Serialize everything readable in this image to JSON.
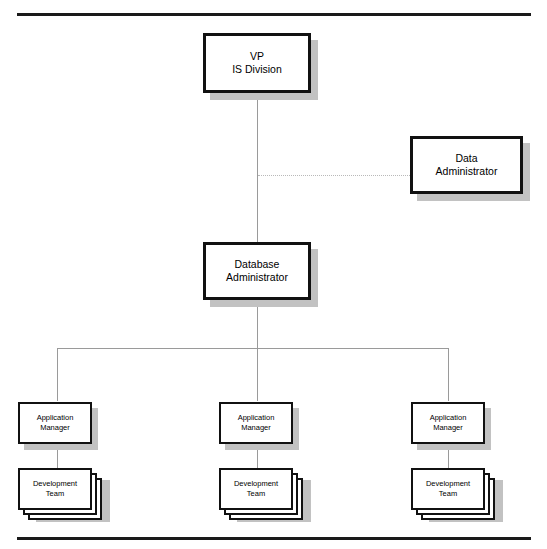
{
  "diagram": {
    "type": "organization-chart",
    "nodes": {
      "vp": {
        "line1": "VP",
        "line2": "IS Division"
      },
      "data_admin": {
        "line1": "Data",
        "line2": "Administrator"
      },
      "dba": {
        "line1": "Database",
        "line2": "Administrator"
      },
      "app_mgr_1": {
        "line1": "Application",
        "line2": "Manager"
      },
      "app_mgr_2": {
        "line1": "Application",
        "line2": "Manager"
      },
      "app_mgr_3": {
        "line1": "Application",
        "line2": "Manager"
      },
      "dev_team_1": {
        "line1": "Development",
        "line2": "Team"
      },
      "dev_team_2": {
        "line1": "Development",
        "line2": "Team"
      },
      "dev_team_3": {
        "line1": "Development",
        "line2": "Team"
      }
    },
    "colors": {
      "box_border": "#111111",
      "box_fill": "#ffffff",
      "shadow": "#c2c2c2",
      "connector": "#9a9a9a",
      "dotted_connector": "#b9b9b9",
      "rule": "#1a1a1a"
    },
    "connections": [
      {
        "from": "vp",
        "to": "dba",
        "style": "solid"
      },
      {
        "from": "vp",
        "to": "data_admin",
        "style": "dotted"
      },
      {
        "from": "dba",
        "to": "app_mgr_1",
        "style": "solid"
      },
      {
        "from": "dba",
        "to": "app_mgr_2",
        "style": "solid"
      },
      {
        "from": "dba",
        "to": "app_mgr_3",
        "style": "solid"
      },
      {
        "from": "app_mgr_1",
        "to": "dev_team_1",
        "style": "solid"
      },
      {
        "from": "app_mgr_2",
        "to": "dev_team_2",
        "style": "solid"
      },
      {
        "from": "app_mgr_3",
        "to": "dev_team_3",
        "style": "solid"
      }
    ]
  }
}
